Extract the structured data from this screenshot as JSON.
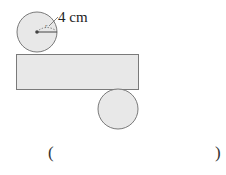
{
  "figure": {
    "radius_label": "4 cm",
    "radius_symbol": "r",
    "colors": {
      "fill": "#e8e8e8",
      "stroke": "#7a7a7a",
      "text": "#222222"
    },
    "top_circle": {
      "cx": 37,
      "cy": 32,
      "r": 20
    },
    "rectangle": {
      "x": 16,
      "y": 54,
      "width": 122,
      "height": 35
    },
    "bottom_circle": {
      "cx": 118,
      "cy": 109,
      "r": 20
    }
  },
  "answer": {
    "open_paren": "(",
    "close_paren": ")",
    "value": ""
  }
}
